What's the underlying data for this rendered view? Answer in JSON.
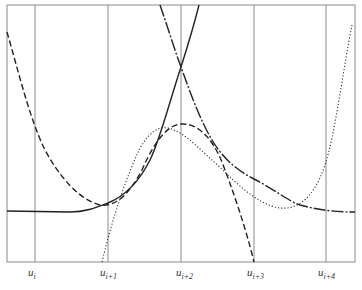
{
  "figure": {
    "type": "B-spline basis functions on uniform knots",
    "knots": [
      {
        "base": "u",
        "sub": "i"
      },
      {
        "base": "u",
        "sub": "i+1"
      },
      {
        "base": "u",
        "sub": "i+2"
      },
      {
        "base": "u",
        "sub": "i+3"
      },
      {
        "base": "u",
        "sub": "i+4"
      }
    ],
    "curves": [
      {
        "name": "solid-curve-left",
        "style": "solid",
        "description": "flat then rising steeply past u_{i+2}"
      },
      {
        "name": "dashdot-curve-right",
        "style": "dash-dot",
        "description": "descending from top through u_{i+2} then flattening after u_{i+3}"
      },
      {
        "name": "dashed-curve",
        "style": "dashed",
        "description": "hump with maximum at u_{i+2}"
      },
      {
        "name": "dotted-curve",
        "style": "dotted",
        "description": "rises from u_{i+1}, dips near u_{i+3}, rises to right edge"
      }
    ],
    "colors": {
      "grid": "#888888",
      "frame": "#888888",
      "curve": "#222222"
    }
  }
}
